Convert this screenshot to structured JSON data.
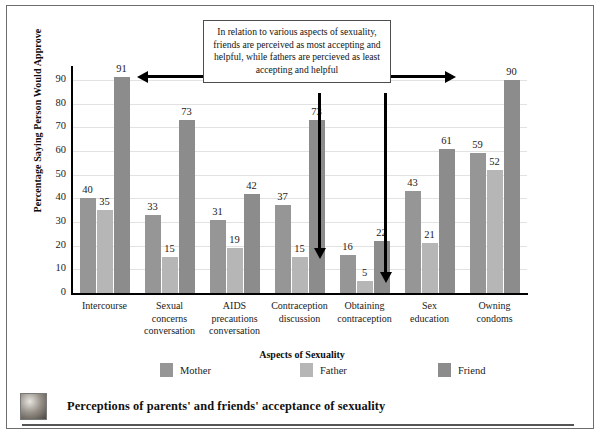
{
  "figure": {
    "caption": "Perceptions of parents' and friends' acceptance of sexuality",
    "thumbnail_name": "photo-thumbnail"
  },
  "annotation": {
    "text": "In relation to various aspects of sexuality, friends are perceived as most accepting and helpful, while fathers are percieved as least accepting and helpful"
  },
  "colors": {
    "mother": "#969696",
    "father": "#b6b6b6",
    "friend": "#8c8c8c",
    "grid": "#e2e2e2",
    "axis": "#000000",
    "frame": "#6d6d6d"
  },
  "chart_data": {
    "type": "bar",
    "title": "",
    "xlabel": "Aspects of Sexuality",
    "ylabel": "Percentage Saying Person Would Approve",
    "ylim": [
      0,
      95
    ],
    "yticks": [
      0,
      10,
      20,
      30,
      40,
      50,
      60,
      70,
      80,
      90
    ],
    "grid": true,
    "legend_position": "bottom",
    "categories": [
      "Intercourse",
      "Sexual concerns conversation",
      "AIDS precautions conversation",
      "Contraception discussion",
      "Obtaining contraception",
      "Sex education",
      "Owning condoms"
    ],
    "category_lines": [
      [
        "Intercourse"
      ],
      [
        "Sexual",
        "concerns",
        "conversation"
      ],
      [
        "AIDS",
        "precautions",
        "conversation"
      ],
      [
        "Contraception",
        "discussion"
      ],
      [
        "Obtaining",
        "contraception"
      ],
      [
        "Sex",
        "education"
      ],
      [
        "Owning",
        "condoms"
      ]
    ],
    "series": [
      {
        "name": "Mother",
        "values": [
          40,
          33,
          31,
          37,
          16,
          43,
          59
        ]
      },
      {
        "name": "Father",
        "values": [
          35,
          15,
          19,
          15,
          5,
          21,
          52
        ]
      },
      {
        "name": "Friend",
        "values": [
          91,
          73,
          42,
          73,
          22,
          61,
          90
        ]
      }
    ]
  }
}
